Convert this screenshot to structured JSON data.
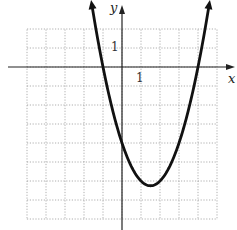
{
  "chart_data": {
    "type": "line",
    "title": "",
    "xlabel": "x",
    "ylabel": "y",
    "xlim": [
      -5,
      5
    ],
    "ylim": [
      -8,
      2
    ],
    "grid": true,
    "grid_style": "dotted",
    "tick_labels": {
      "x": [
        "1"
      ],
      "y": [
        "1"
      ]
    },
    "series": [
      {
        "name": "parabola",
        "equation": "y = x^2 - 3x - 4",
        "vertex": [
          1.5,
          -6.25
        ],
        "x_intercepts": [
          -1,
          4
        ],
        "y_intercept": -4,
        "arrows": "both ends",
        "x": [
          -1.6,
          -1,
          0,
          1,
          1.5,
          2,
          3,
          4,
          4.6
        ],
        "values": [
          1.36,
          0,
          -4,
          -6,
          -6.25,
          -6,
          -4,
          0,
          1.36
        ]
      }
    ],
    "legend": null
  },
  "axes": {
    "x_label": "x",
    "y_label": "y",
    "x_tick": "1",
    "y_tick": "1"
  },
  "colors": {
    "curve": "#111111",
    "axis": "#222222",
    "grid": "#9a9a9a",
    "background": "#ffffff"
  }
}
